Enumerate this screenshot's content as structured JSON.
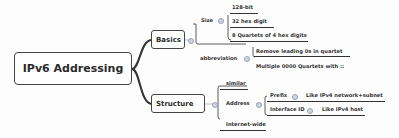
{
  "root": {
    "label": "IPv6 Addressing"
  },
  "branches": [
    {
      "label": "Basics",
      "children": [
        {
          "label": "Size",
          "children": [
            {
              "label": "128-bit"
            },
            {
              "label": "32 hex digit"
            },
            {
              "label": "8 Quartets of 4 hex digits"
            }
          ]
        },
        {
          "label": "abbreviation",
          "children": [
            {
              "label": "Remove leading 0s in quartet"
            },
            {
              "label": "Multiple 0000 Quartets with ::"
            }
          ]
        }
      ]
    },
    {
      "label": "Structure",
      "children": [
        {
          "label": "similar"
        },
        {
          "label": "Address",
          "children": [
            {
              "label": "Prefix",
              "note": "Like IPv4 network+subnet"
            },
            {
              "label": "Interface ID",
              "note": "Like IPv4 host"
            }
          ]
        },
        {
          "label": "Internet-wide"
        }
      ]
    }
  ],
  "colors": {
    "line": "#333333",
    "toggle": "#cfd4e0",
    "background": "#fdfdfd"
  }
}
